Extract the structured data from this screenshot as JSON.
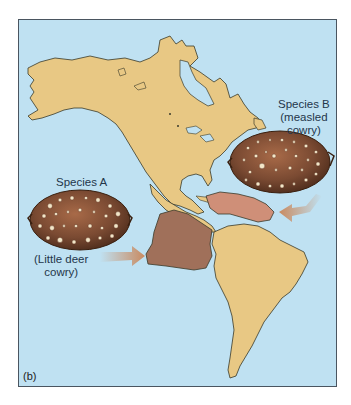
{
  "figure": {
    "panel_label": "(b)",
    "colors": {
      "ocean": "#bfe1f2",
      "land": "#e8c884",
      "land_outline": "#3a3a2a",
      "range_species_a": "#a0705a",
      "range_species_b": "#cf8f78",
      "shell_body": "#7a4a32",
      "shell_spots": "#f2e6c8",
      "arrow": "#c98a60",
      "frame_border": "#4a5560"
    }
  },
  "species_a": {
    "title": "Species A",
    "common_name_line1": "(Little deer",
    "common_name_line2": "cowry)"
  },
  "species_b": {
    "title": "Species B",
    "common_name_line1": "(measled",
    "common_name_line2": "cowry)"
  }
}
